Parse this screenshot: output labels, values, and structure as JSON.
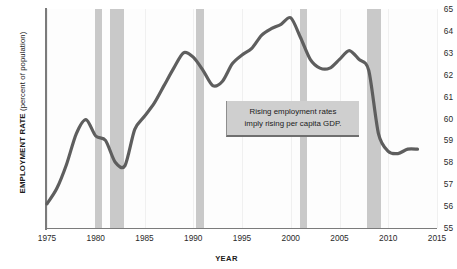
{
  "chart_data": {
    "type": "line",
    "title": "",
    "xlabel": "YEAR",
    "ylabel": "EMPLOYMENT RATE (percent of population)",
    "ylabel_bold_part": "EMPLOYMENT RATE",
    "ylabel_plain_part": " (percent of population)",
    "xlim": [
      1975,
      2015
    ],
    "ylim": [
      55,
      65
    ],
    "grid": false,
    "legend": "none",
    "yticks": [
      55,
      56,
      57,
      58,
      59,
      60,
      61,
      62,
      63,
      64,
      65
    ],
    "xticks": [
      1975,
      1980,
      1985,
      1990,
      1995,
      2000,
      2005,
      2010,
      2015
    ],
    "series": [
      {
        "name": "Employment rate",
        "color": "#5e5e5e",
        "x": [
          1975,
          1976,
          1977,
          1978,
          1979,
          1980,
          1981,
          1982,
          1983,
          1984,
          1985,
          1986,
          1987,
          1988,
          1989,
          1990,
          1991,
          1992,
          1993,
          1994,
          1995,
          1996,
          1997,
          1998,
          1999,
          2000,
          2001,
          2002,
          2003,
          2004,
          2005,
          2006,
          2007,
          2008,
          2009,
          2010,
          2011,
          2012,
          2013
        ],
        "values": [
          56.1,
          56.8,
          57.9,
          59.3,
          59.95,
          59.2,
          59.0,
          58.0,
          57.85,
          59.5,
          60.1,
          60.7,
          61.5,
          62.3,
          63.0,
          62.8,
          62.2,
          61.5,
          61.7,
          62.5,
          62.9,
          63.2,
          63.8,
          64.1,
          64.3,
          64.6,
          63.7,
          62.7,
          62.3,
          62.3,
          62.7,
          63.1,
          62.7,
          62.2,
          59.3,
          58.5,
          58.4,
          58.6,
          58.6
        ],
        "line_width_px": 3.2
      }
    ],
    "recession_bands": [
      {
        "label": "1980 recession",
        "start": 1979.9,
        "end": 1980.6
      },
      {
        "label": "1981-82 recession",
        "start": 1981.5,
        "end": 1982.9
      },
      {
        "label": "1990-91 recession",
        "start": 1990.3,
        "end": 1991.1
      },
      {
        "label": "2001 recession",
        "start": 2000.9,
        "end": 2001.7
      },
      {
        "label": "2007-09 recession",
        "start": 2007.8,
        "end": 2009.3
      }
    ],
    "annotation": {
      "line1": "Rising employment rates",
      "line2": "imply rising per capita GDP.",
      "background": "#cfcfcf"
    },
    "colors": {
      "line": "#5e5e5e",
      "recession_band": "#c9c9c9",
      "axis": "#7b7b7b",
      "plot_background": "#fdfdfd",
      "figure_background": "#ffffff",
      "text": "#1b1b1b"
    }
  }
}
